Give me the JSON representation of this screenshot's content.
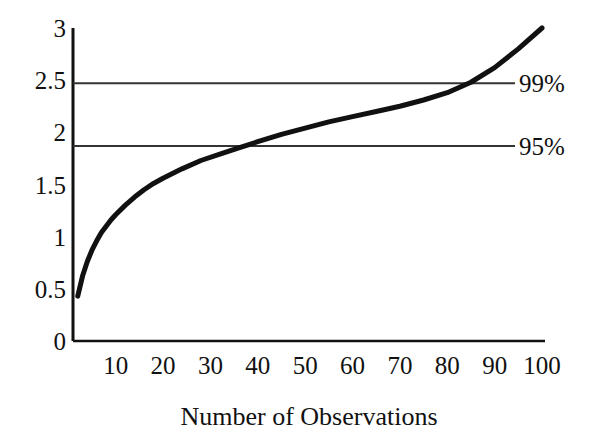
{
  "chart_data": {
    "type": "line",
    "title": "",
    "subtitle": "",
    "xlabel": "Number of Observations",
    "ylabel": "",
    "xlim": [
      1,
      100
    ],
    "ylim": [
      0,
      3
    ],
    "grid": false,
    "legend_position": "right-inline",
    "x_ticks": [
      "10",
      "20",
      "30",
      "40",
      "50",
      "60",
      "70",
      "80",
      "90",
      "100"
    ],
    "x_tick_values": [
      10,
      20,
      30,
      40,
      50,
      60,
      70,
      80,
      90,
      100
    ],
    "y_ticks": [
      "0",
      "0.5",
      "1",
      "1.5",
      "2",
      "2.5",
      "3"
    ],
    "y_tick_values": [
      0,
      0.5,
      1,
      1.5,
      2,
      2.5,
      3
    ],
    "series": [
      {
        "name": "critical-value-curve",
        "color": "#111111",
        "line_width": 5,
        "x": [
          2,
          3,
          4,
          5,
          6,
          7,
          8,
          9,
          10,
          12,
          14,
          16,
          18,
          20,
          24,
          28,
          32,
          36,
          40,
          45,
          50,
          55,
          60,
          65,
          70,
          75,
          80,
          85,
          90,
          95,
          100
        ],
        "values": [
          0.43,
          0.62,
          0.76,
          0.87,
          0.96,
          1.04,
          1.1,
          1.16,
          1.21,
          1.3,
          1.38,
          1.45,
          1.51,
          1.56,
          1.65,
          1.73,
          1.79,
          1.85,
          1.91,
          1.98,
          2.04,
          2.1,
          2.15,
          2.2,
          2.25,
          2.31,
          2.38,
          2.48,
          2.62,
          2.8,
          3.0
        ]
      }
    ],
    "reference_lines": [
      {
        "name": "99%",
        "label": "99%",
        "value": 2.47,
        "color": "#333333",
        "line_width": 2
      },
      {
        "name": "95%",
        "label": "95%",
        "value": 1.87,
        "color": "#333333",
        "line_width": 2
      }
    ],
    "annotations": [
      {
        "text": "99%",
        "at_y": 2.47
      },
      {
        "text": "95%",
        "at_y": 1.87
      }
    ]
  },
  "axes": {
    "x_title": "Number of Observations"
  }
}
